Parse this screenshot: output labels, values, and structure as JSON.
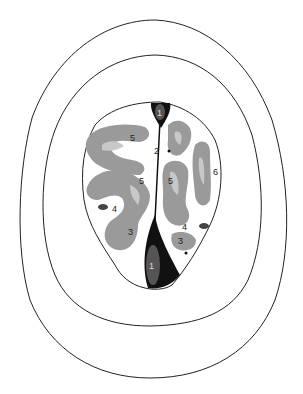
{
  "figure": {
    "type": "anatomical cross-section diagram",
    "colors": {
      "background": "#ffffff",
      "outline": "#222222",
      "gyrus_dark_gray": "#9a9a9a",
      "gyrus_light_gray": "#c8c8c8",
      "sinus_black": "#111111",
      "sinus_inner": "#555555",
      "lesion": "#444444"
    },
    "labels": [
      {
        "id": "1",
        "text": "1",
        "x": 160,
        "y": 116,
        "region": "top"
      },
      {
        "id": "5a",
        "text": "5",
        "x": 133,
        "y": 140
      },
      {
        "id": "2",
        "text": "2",
        "x": 157,
        "y": 153
      },
      {
        "id": "6",
        "text": "6",
        "x": 215,
        "y": 174
      },
      {
        "id": "5b",
        "text": "5",
        "x": 141,
        "y": 183
      },
      {
        "id": "5c",
        "text": "5",
        "x": 171,
        "y": 183
      },
      {
        "id": "4a",
        "text": "4",
        "x": 115,
        "y": 210
      },
      {
        "id": "4b",
        "text": "4",
        "x": 185,
        "y": 228
      },
      {
        "id": "3a",
        "text": "3",
        "x": 131,
        "y": 234
      },
      {
        "id": "3b",
        "text": "3",
        "x": 181,
        "y": 242
      },
      {
        "id": "1b",
        "text": "1",
        "x": 152,
        "y": 268,
        "region": "bottom"
      }
    ]
  }
}
